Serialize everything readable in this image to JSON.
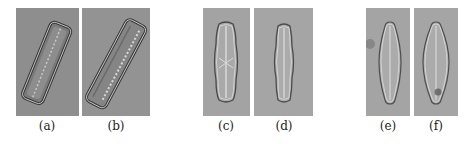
{
  "figure": {
    "panels": [
      {
        "id": "a",
        "label": "(a)",
        "description": "rectangular diatom, tilted, dark textured frustule",
        "background": "#8e8e8e"
      },
      {
        "id": "b",
        "label": "(b)",
        "description": "rectangular diatom, tilted, striated frustule",
        "background": "#939393"
      },
      {
        "id": "c",
        "label": "(c)",
        "description": "elongated diatom, vertical, central cross area",
        "background": "#a3a3a3"
      },
      {
        "id": "d",
        "label": "(d)",
        "description": "elongated diatom, vertical",
        "background": "#a5a5a5"
      },
      {
        "id": "e",
        "label": "(e)",
        "description": "lanceolate diatom, vertical",
        "background": "#a4a4a4"
      },
      {
        "id": "f",
        "label": "(f)",
        "description": "lanceolate diatom, vertical, small debris",
        "background": "#a5a5a5"
      }
    ]
  }
}
